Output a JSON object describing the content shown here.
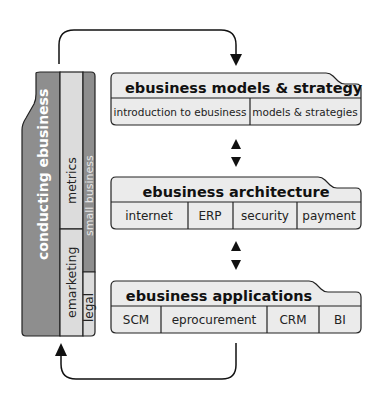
{
  "left_block": {
    "main_label": "conducting ebusiness",
    "columns": [
      {
        "label": "metrics"
      },
      {
        "label": "emarketing"
      },
      {
        "label": "small business"
      },
      {
        "label": "legal"
      }
    ]
  },
  "boxes": [
    {
      "title": "ebusiness models & strategy",
      "cells": [
        "introduction to ebusiness",
        "models & strategies"
      ]
    },
    {
      "title": "ebusiness architecture",
      "cells": [
        "internet",
        "ERP",
        "security",
        "payment"
      ]
    },
    {
      "title": "ebusiness applications",
      "cells": [
        "SCM",
        "eprocurement",
        "CRM",
        "BI"
      ]
    }
  ],
  "colors": {
    "dark_gray": "#8e8e8e",
    "light_gray": "#dcdcdc",
    "box_fill": "#ebebeb",
    "stroke": "#222222"
  }
}
